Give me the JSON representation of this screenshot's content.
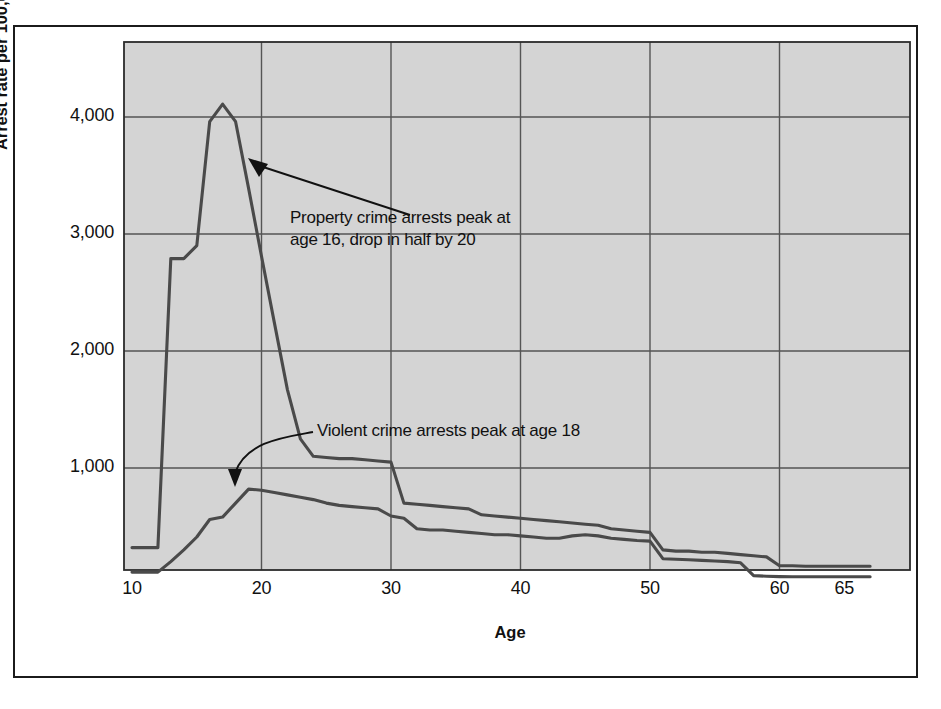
{
  "figure": {
    "background_color": "#ffffff",
    "plot_background_color": "#d4d4d4",
    "line_color": "#4a4a4a",
    "grid_color": "#555555",
    "frame_color": "#1b1b1b"
  },
  "axes": {
    "ylabel": "Arrest rate per 100,000 persons",
    "xlabel": "Age",
    "yticks": [
      "1,000",
      "2,000",
      "3,000",
      "4,000"
    ],
    "ytick_values": [
      1000,
      2000,
      3000,
      4000
    ],
    "xticks": [
      "10",
      "20",
      "30",
      "40",
      "50",
      "60",
      "65"
    ],
    "xtick_values": [
      10,
      20,
      30,
      40,
      50,
      60,
      65
    ]
  },
  "annotations": [
    {
      "id": "property-note",
      "text": "Property crime arrests peak at\nage 16, drop in half by 20",
      "x": 290,
      "y": 207,
      "arrow": {
        "tail_x": 410,
        "tail_y": 215,
        "head_x": 248,
        "head_y": 158
      }
    },
    {
      "id": "violent-note",
      "text": "Violent crime arrests peak at age 18",
      "x": 317,
      "y": 420,
      "arrow": {
        "tail_x": 313,
        "tail_y": 432,
        "head_x": 235,
        "head_y": 487
      }
    }
  ],
  "chart_data": {
    "type": "line",
    "title": "",
    "xlabel": "Age",
    "ylabel": "Arrest rate per 100,000 persons",
    "xlim": [
      10,
      67
    ],
    "ylim": [
      0,
      4500
    ],
    "grid": true,
    "legend": "none",
    "x": [
      10,
      11,
      12,
      13,
      14,
      15,
      16,
      17,
      18,
      19,
      20,
      21,
      22,
      23,
      24,
      25,
      26,
      27,
      28,
      29,
      30,
      31,
      32,
      33,
      34,
      35,
      36,
      37,
      38,
      39,
      40,
      41,
      42,
      43,
      44,
      45,
      46,
      47,
      48,
      49,
      50,
      51,
      52,
      53,
      54,
      55,
      56,
      57,
      58,
      59,
      60,
      61,
      62,
      63,
      64,
      65,
      66,
      67
    ],
    "series": [
      {
        "name": "Property crime arrests",
        "values": [
          320,
          320,
          320,
          2790,
          2790,
          2900,
          3960,
          4110,
          3960,
          3390,
          2810,
          2240,
          1670,
          1250,
          1100,
          1090,
          1080,
          1080,
          1070,
          1060,
          1050,
          700,
          690,
          680,
          670,
          660,
          650,
          600,
          590,
          580,
          570,
          560,
          550,
          540,
          530,
          520,
          510,
          480,
          470,
          460,
          450,
          300,
          290,
          290,
          280,
          280,
          270,
          260,
          250,
          240,
          165,
          165,
          160,
          160,
          160,
          160,
          160,
          160
        ]
      },
      {
        "name": "Violent crime arrests",
        "values": [
          110,
          110,
          110,
          200,
          300,
          410,
          560,
          580,
          700,
          820,
          810,
          790,
          770,
          750,
          730,
          700,
          680,
          670,
          660,
          650,
          590,
          570,
          480,
          470,
          470,
          460,
          450,
          440,
          430,
          430,
          420,
          410,
          400,
          400,
          420,
          430,
          420,
          400,
          390,
          380,
          375,
          225,
          220,
          215,
          210,
          205,
          200,
          190,
          80,
          75,
          72,
          70,
          70,
          70,
          70,
          70,
          70,
          70
        ]
      }
    ]
  }
}
